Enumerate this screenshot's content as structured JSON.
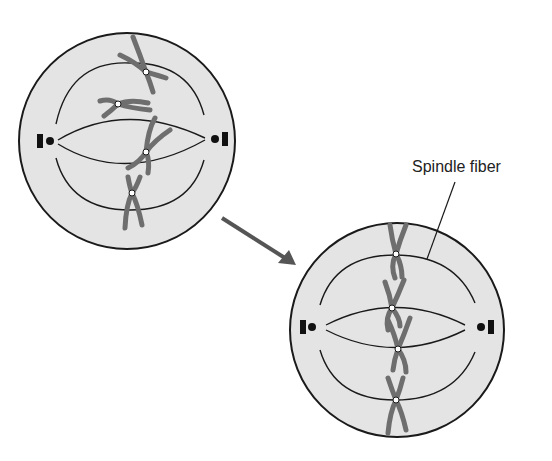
{
  "diagram": {
    "colors": {
      "cell_fill": "#e4e4e4",
      "outline": "#1a1a1a",
      "chromosome": "#6e6e6e",
      "arrow": "#555555",
      "centromere": "#ffffff"
    },
    "cells": [
      {
        "id": "before",
        "description": "Prometaphase: chromosomes scattered, attaching to spindle fibers"
      },
      {
        "id": "after",
        "description": "Metaphase: chromosomes aligned along the cell equator"
      }
    ],
    "labels": {
      "spindle_fiber": "Spindle fiber"
    },
    "arrow": {
      "from": "before",
      "to": "after"
    }
  }
}
